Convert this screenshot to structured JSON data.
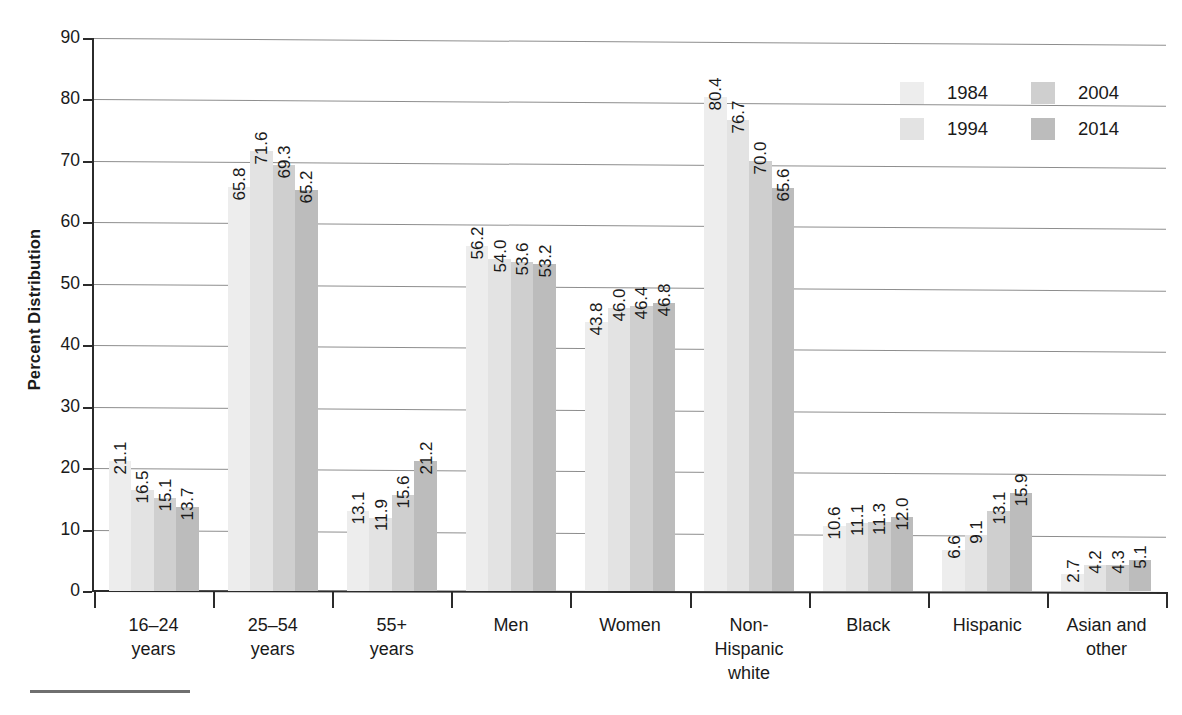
{
  "chart_data": {
    "type": "bar",
    "title": "",
    "xlabel": "",
    "ylabel": "Percent Distribution",
    "ylim": [
      0,
      90
    ],
    "ytick_step": 10,
    "yticks": [
      "0",
      "10",
      "20",
      "30",
      "40",
      "50",
      "60",
      "70",
      "80",
      "90"
    ],
    "grid": true,
    "legend_position": "top-right",
    "categories": [
      "16–24\nyears",
      "25–54\nyears",
      "55+\nyears",
      "Men",
      "Women",
      "Non-\nHispanic\nwhite",
      "Black",
      "Hispanic",
      "Asian and\nother"
    ],
    "series": [
      {
        "name": "1984",
        "color": "#ededed",
        "values": [
          21.1,
          65.8,
          13.1,
          56.2,
          43.8,
          80.4,
          10.6,
          6.6,
          2.7
        ]
      },
      {
        "name": "1994",
        "color": "#e3e3e3",
        "values": [
          16.5,
          71.6,
          11.9,
          54.0,
          46.0,
          76.7,
          11.1,
          9.1,
          4.2
        ]
      },
      {
        "name": "2004",
        "color": "#cfcfcf",
        "values": [
          15.1,
          69.3,
          15.6,
          53.6,
          46.4,
          70.0,
          11.3,
          13.1,
          4.3
        ]
      },
      {
        "name": "2014",
        "color": "#bcbcbc",
        "values": [
          13.7,
          65.2,
          21.2,
          53.2,
          46.8,
          65.6,
          12.0,
          15.9,
          5.1
        ]
      }
    ],
    "value_labels": [
      [
        "21.1",
        "16.5",
        "15.1",
        "13.7"
      ],
      [
        "65.8",
        "71.6",
        "69.3",
        "65.2"
      ],
      [
        "13.1",
        "11.9",
        "15.6",
        "21.2"
      ],
      [
        "56.2",
        "54.0",
        "53.6",
        "53.2"
      ],
      [
        "43.8",
        "46.0",
        "46.4",
        "46.8"
      ],
      [
        "80.4",
        "76.7",
        "70.0",
        "65.6"
      ],
      [
        "10.6",
        "11.1",
        "11.3",
        "12.0"
      ],
      [
        "6.6",
        "9.1",
        "13.1",
        "15.9"
      ],
      [
        "2.7",
        "4.2",
        "4.3",
        "5.1"
      ]
    ]
  },
  "legend": {
    "entries": [
      {
        "label": "1984",
        "color": "#ededed"
      },
      {
        "label": "2004",
        "color": "#cfcfcf"
      },
      {
        "label": "1994",
        "color": "#e3e3e3"
      },
      {
        "label": "2014",
        "color": "#bcbcbc"
      }
    ]
  },
  "axis": {
    "y_title": "Percent Distribution"
  },
  "colors": {
    "axis": "#2b2b2b",
    "gridline": "#8e8e8e",
    "text": "#1a1a1a",
    "background": "#ffffff"
  }
}
